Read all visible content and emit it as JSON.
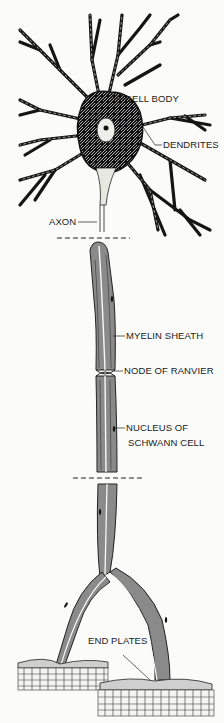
{
  "diagram": {
    "labels": {
      "cell_body": "CELL BODY",
      "dendrites": "DENDRITES",
      "axon": "AXON",
      "myelin_sheath": "MYELIN SHEATH",
      "node_of_ranvier": "NODE  OF RANVIER",
      "nucleus_line1": "NUCLEUS  OF",
      "nucleus_line2": "SCHWANN CELL",
      "end_plates": "END PLATES"
    },
    "colors": {
      "ink": "#151515",
      "sheath": "#8a8a8a",
      "background": "#fbfbf9"
    }
  }
}
